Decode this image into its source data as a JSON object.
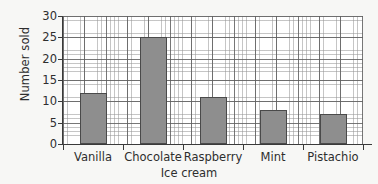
{
  "chart_data": {
    "type": "bar",
    "title": "",
    "subtitle": "",
    "categories": [
      "Vanilla",
      "Chocolate",
      "Raspberry",
      "Mint",
      "Pistachio"
    ],
    "values": [
      12,
      25,
      11,
      8,
      7
    ],
    "xlabel": "Ice cream",
    "ylabel": "Number sold",
    "ylim": [
      0,
      30
    ],
    "ytick_labels": [
      "0",
      "5",
      "10",
      "15",
      "20",
      "25",
      "30"
    ],
    "ytick_values": [
      0,
      5,
      10,
      15,
      20,
      25,
      30
    ],
    "y_major_step": 5,
    "y_minor_per_major": 5,
    "grid": true,
    "legend": null,
    "legend_position": "none",
    "annotations": [],
    "colors": {
      "bar_fill": "#8e8e8e",
      "bar_border": "#4a4a4a",
      "plot_background": "#ffffff",
      "page_background": "#f7f7f5",
      "axis": "#3a3a3a",
      "grid_major": "#5f5f5f",
      "grid_minor": "#969696",
      "text": "#2e2e2e"
    }
  }
}
